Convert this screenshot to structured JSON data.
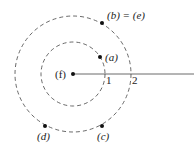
{
  "diagram": {
    "center": {
      "label": "(f)"
    },
    "circles": [
      {
        "name": "inner",
        "tick_label": "1"
      },
      {
        "name": "outer",
        "tick_label": "2"
      }
    ],
    "points": {
      "a": {
        "label": "(a)"
      },
      "b": {
        "label": "(b) = (e)"
      },
      "c": {
        "label": "(c)"
      },
      "d": {
        "label": "(d)"
      }
    },
    "colors": {
      "stroke": "#333333",
      "background": "#ffffff"
    }
  }
}
